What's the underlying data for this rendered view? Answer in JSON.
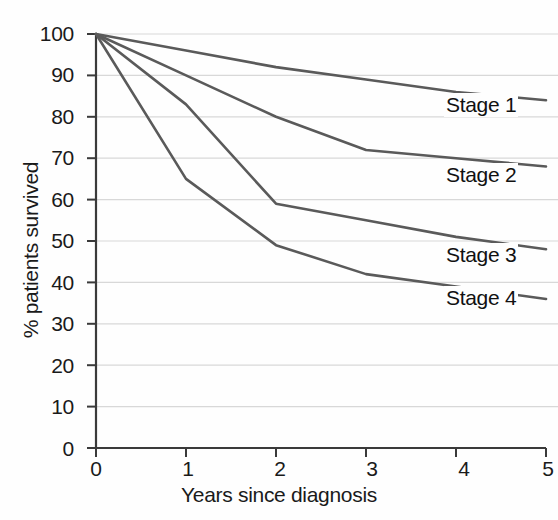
{
  "chart_data": {
    "type": "line",
    "title": "",
    "xlabel": "Years since diagnosis",
    "ylabel": "% patients survived",
    "xlim": [
      0,
      5
    ],
    "ylim": [
      0,
      100
    ],
    "x": [
      0,
      1,
      2,
      3,
      4,
      5
    ],
    "xticks": [
      "0",
      "1",
      "2",
      "3",
      "4",
      "5"
    ],
    "yticks": [
      "0",
      "10",
      "20",
      "30",
      "40",
      "50",
      "60",
      "70",
      "80",
      "90",
      "100"
    ],
    "grid": true,
    "legend_position": "inline-right",
    "line_color": "#5a5a5a",
    "grid_color": "#d8d8d8",
    "axis_color": "#3a3a3a",
    "series": [
      {
        "name": "Stage 1",
        "values": [
          100,
          96,
          92,
          89,
          86,
          84
        ]
      },
      {
        "name": "Stage 2",
        "values": [
          100,
          90,
          80,
          72,
          70,
          68
        ]
      },
      {
        "name": "Stage 3",
        "values": [
          100,
          83,
          59,
          55,
          51,
          48
        ]
      },
      {
        "name": "Stage 4",
        "values": [
          100,
          65,
          49,
          42,
          39,
          36
        ]
      }
    ]
  },
  "labels": {
    "y_axis_title": "% patients survived",
    "x_axis_title": "Years since diagnosis",
    "series": [
      {
        "text": "Stage 1"
      },
      {
        "text": "Stage 2"
      },
      {
        "text": "Stage 3"
      },
      {
        "text": "Stage 4"
      }
    ],
    "y_ticks": [
      {
        "text": "100"
      },
      {
        "text": "90"
      },
      {
        "text": "80"
      },
      {
        "text": "70"
      },
      {
        "text": "60"
      },
      {
        "text": "50"
      },
      {
        "text": "40"
      },
      {
        "text": "30"
      },
      {
        "text": "20"
      },
      {
        "text": "10"
      },
      {
        "text": "0"
      }
    ],
    "x_ticks": [
      {
        "text": "0"
      },
      {
        "text": "1"
      },
      {
        "text": "2"
      },
      {
        "text": "3"
      },
      {
        "text": "4"
      },
      {
        "text": "5"
      }
    ]
  }
}
